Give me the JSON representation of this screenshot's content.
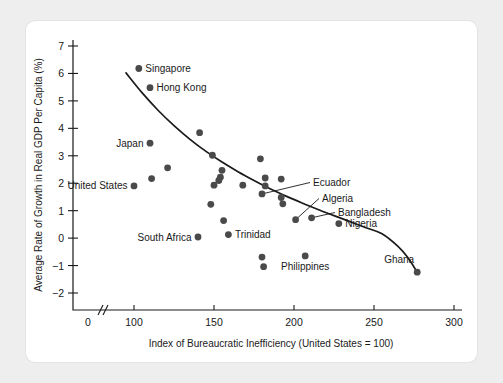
{
  "chart_data": {
    "type": "scatter",
    "title": "",
    "xlabel": "Index of Bureaucratic Inefficiency (United States = 100)",
    "ylabel": "Average Rate of Growth in Real GDP Per Capita (%)",
    "xlim": [
      85,
      305
    ],
    "ylim": [
      -2.4,
      7.4
    ],
    "xticks": [
      0,
      100,
      150,
      200,
      250,
      300
    ],
    "yticks": [
      7,
      6,
      5,
      4,
      3,
      2,
      1,
      0,
      -1,
      -2
    ],
    "ytick_labels": [
      "7",
      "6",
      "5",
      "4",
      "3",
      "2",
      "1",
      "0",
      "−1",
      "−2"
    ],
    "xtick_labels": [
      "0",
      "100",
      "150",
      "200",
      "250",
      "300"
    ],
    "grid": false,
    "legend": "none",
    "axis_break": true,
    "axis_break_note": "broken x-axis between 0 and 100",
    "marker_color": "#4a4a4a",
    "line_color": "#1a1a1a",
    "points": [
      {
        "x": 103,
        "y": 6.18,
        "label": "Singapore",
        "label_side": "right"
      },
      {
        "x": 110,
        "y": 5.48,
        "label": "Hong Kong",
        "label_side": "right"
      },
      {
        "x": 110,
        "y": 3.46,
        "label": "Japan",
        "label_side": "left"
      },
      {
        "x": 100,
        "y": 1.9,
        "label": "United States",
        "label_side": "left"
      },
      {
        "x": 141,
        "y": 3.84,
        "label": "",
        "label_side": ""
      },
      {
        "x": 111,
        "y": 2.17,
        "label": "",
        "label_side": ""
      },
      {
        "x": 121,
        "y": 2.56,
        "label": "",
        "label_side": ""
      },
      {
        "x": 149,
        "y": 3.02,
        "label": "",
        "label_side": ""
      },
      {
        "x": 155,
        "y": 2.47,
        "label": "",
        "label_side": ""
      },
      {
        "x": 154,
        "y": 2.22,
        "label": "",
        "label_side": ""
      },
      {
        "x": 153,
        "y": 2.1,
        "label": "",
        "label_side": ""
      },
      {
        "x": 150,
        "y": 1.93,
        "label": "",
        "label_side": ""
      },
      {
        "x": 168,
        "y": 1.93,
        "label": "",
        "label_side": ""
      },
      {
        "x": 179,
        "y": 2.89,
        "label": "",
        "label_side": ""
      },
      {
        "x": 182,
        "y": 2.19,
        "label": "",
        "label_side": ""
      },
      {
        "x": 192,
        "y": 2.15,
        "label": "",
        "label_side": ""
      },
      {
        "x": 182,
        "y": 1.9,
        "label": "",
        "label_side": ""
      },
      {
        "x": 180,
        "y": 1.61,
        "label": "Ecuador",
        "label_side": "leader"
      },
      {
        "x": 192,
        "y": 1.48,
        "label": "",
        "label_side": ""
      },
      {
        "x": 193,
        "y": 1.25,
        "label": "",
        "label_side": ""
      },
      {
        "x": 148,
        "y": 1.23,
        "label": "",
        "label_side": ""
      },
      {
        "x": 156,
        "y": 0.64,
        "label": "",
        "label_side": ""
      },
      {
        "x": 201,
        "y": 0.67,
        "label": "Algeria",
        "label_side": "leader"
      },
      {
        "x": 211,
        "y": 0.74,
        "label": "Bangladesh",
        "label_side": "leader"
      },
      {
        "x": 228,
        "y": 0.53,
        "label": "Nigeria",
        "label_side": "right"
      },
      {
        "x": 140,
        "y": 0.04,
        "label": "South Africa",
        "label_side": "left"
      },
      {
        "x": 159,
        "y": 0.13,
        "label": "Trinidad",
        "label_side": "right"
      },
      {
        "x": 180,
        "y": -0.69,
        "label": "",
        "label_side": ""
      },
      {
        "x": 181,
        "y": -1.04,
        "label": "",
        "label_side": ""
      },
      {
        "x": 207,
        "y": -0.65,
        "label": "Philippines",
        "label_side": "below"
      },
      {
        "x": 277,
        "y": -1.24,
        "label": "Ghana",
        "label_side": "upper-left"
      }
    ],
    "trend_line": {
      "description": "downward-sloping fitted curve",
      "points": [
        {
          "x": 95,
          "y": 6.02
        },
        {
          "x": 105,
          "y": 5.3
        },
        {
          "x": 115,
          "y": 4.66
        },
        {
          "x": 125,
          "y": 4.1
        },
        {
          "x": 135,
          "y": 3.6
        },
        {
          "x": 145,
          "y": 3.16
        },
        {
          "x": 155,
          "y": 2.77
        },
        {
          "x": 165,
          "y": 2.42
        },
        {
          "x": 175,
          "y": 2.1
        },
        {
          "x": 185,
          "y": 1.8
        },
        {
          "x": 195,
          "y": 1.53
        },
        {
          "x": 205,
          "y": 1.28
        },
        {
          "x": 215,
          "y": 1.04
        },
        {
          "x": 225,
          "y": 0.82
        },
        {
          "x": 235,
          "y": 0.6
        },
        {
          "x": 245,
          "y": 0.38
        },
        {
          "x": 255,
          "y": 0.16
        },
        {
          "x": 265,
          "y": -0.3
        },
        {
          "x": 271,
          "y": -0.7
        },
        {
          "x": 277,
          "y": -1.24
        }
      ]
    }
  }
}
